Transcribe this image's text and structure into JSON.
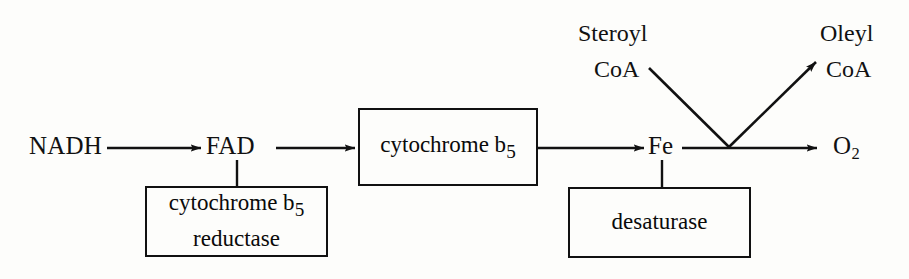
{
  "figure": {
    "background_color": "#fdfdfb",
    "stroke_color": "#111111"
  },
  "nodes": {
    "nadh": {
      "label": "NADH"
    },
    "fad": {
      "label": "FAD"
    },
    "fe": {
      "label": "Fe"
    },
    "o2": {
      "label": "O",
      "subscript": "2"
    },
    "steroyl_coa": {
      "line1": "Steroyl",
      "line2": "CoA"
    },
    "oleyl_coa": {
      "line1": "Oleyl",
      "line2": "CoA"
    }
  },
  "boxes": {
    "cytochrome_b5": {
      "text": "cytochrome b",
      "subscript": "5"
    },
    "cytochrome_b5_reductase": {
      "line1": "cytochrome b",
      "subscript": "5",
      "line2": "reductase"
    },
    "desaturase": {
      "text": "desaturase"
    }
  },
  "connectors": {
    "nadh_to_fad": {
      "type": "arrow"
    },
    "fad_to_cytochrome_b5": {
      "type": "arrow"
    },
    "cytochrome_b5_to_fe": {
      "type": "arrow"
    },
    "fe_to_o2": {
      "type": "arrow"
    },
    "fad_to_reductase": {
      "type": "tick"
    },
    "fe_to_desaturase": {
      "type": "tick"
    },
    "steroyl_coa_to_junction": {
      "type": "line"
    },
    "junction_to_oleyl_coa": {
      "type": "arrow"
    }
  }
}
